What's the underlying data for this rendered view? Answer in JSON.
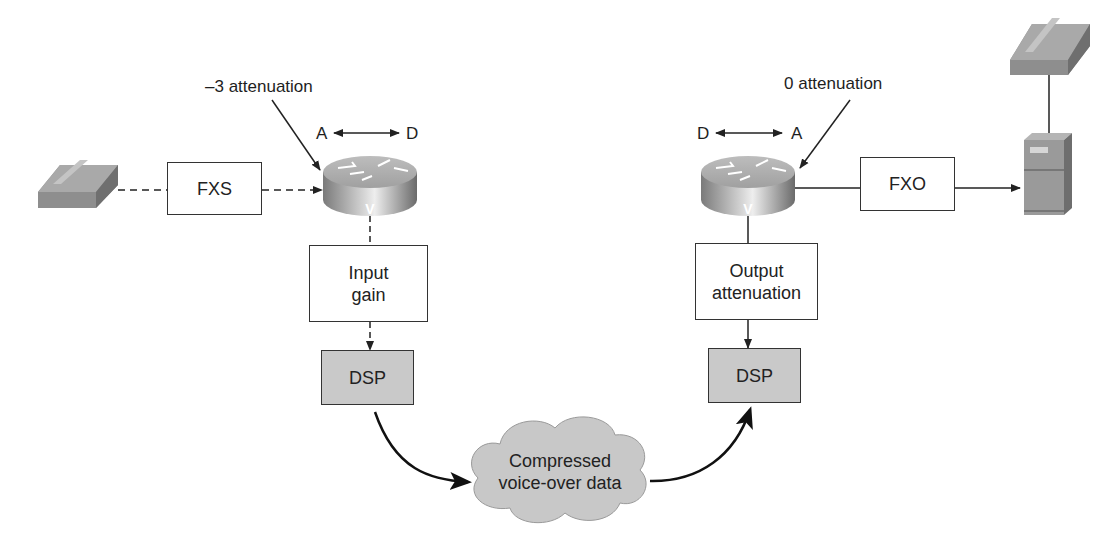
{
  "left": {
    "attenuation_label": "–3 attenuation",
    "conversion": {
      "from": "A",
      "to": "D"
    },
    "interface_box": "FXS",
    "gain_box": {
      "line1": "Input",
      "line2": "gain"
    },
    "dsp_box": "DSP",
    "router_mark": "V",
    "line_style": "dashed"
  },
  "right": {
    "attenuation_label": "0 attenuation",
    "conversion": {
      "from": "D",
      "to": "A"
    },
    "interface_box": "FXO",
    "attenuation_box": {
      "line1": "Output",
      "line2": "attenuation"
    },
    "dsp_box": "DSP",
    "router_mark": "V",
    "line_style": "solid"
  },
  "cloud": {
    "line1": "Compressed",
    "line2": "voice-over data"
  },
  "icons": [
    "telephone-icon",
    "router-icon",
    "router-icon",
    "pbx-server-icon",
    "telephone-icon",
    "cloud-icon"
  ],
  "colors": {
    "box_fill": "#ffffff",
    "dsp_fill": "#c9c9c9",
    "cloud_fill": "#c8c8c8",
    "stroke": "#222222"
  }
}
